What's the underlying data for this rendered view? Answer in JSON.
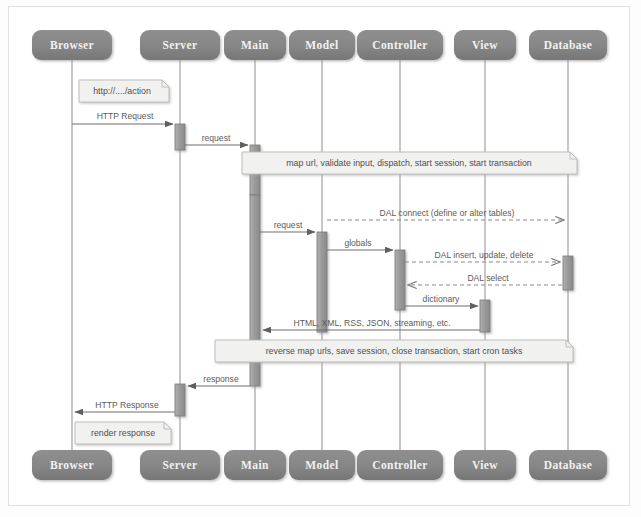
{
  "diagram": {
    "type": "uml-sequence-diagram",
    "colors": {
      "lifeline_box_fill": "#858585",
      "lifeline_box_fill_dark": "#6e6e6e",
      "lifeline_label_text": "#f2f2f2",
      "lifeline_line": "#9a9a9a",
      "activation_fill": "#9d9d9d",
      "activation_stroke": "#7a7a7a",
      "message_line": "#6f6f6f",
      "message_text": "#5b5b5b",
      "note_fill": "#f0f0ee",
      "note_stroke": "#b9b9b9",
      "note_text": "#4f4f4f",
      "canvas": "#ffffff",
      "frame_border": "#e2e2e2"
    },
    "participants": [
      {
        "id": "browser",
        "label": "Browser",
        "x": 72,
        "box_width": 80
      },
      {
        "id": "server",
        "label": "Server",
        "x": 180,
        "box_width": 80
      },
      {
        "id": "main",
        "label": "Main",
        "x": 255,
        "box_width": 62
      },
      {
        "id": "model",
        "label": "Model",
        "x": 322,
        "box_width": 66
      },
      {
        "id": "controller",
        "label": "Controller",
        "x": 400,
        "box_width": 86
      },
      {
        "id": "view",
        "label": "View",
        "x": 485,
        "box_width": 62
      },
      {
        "id": "database",
        "label": "Database",
        "x": 568,
        "box_width": 78
      }
    ],
    "header_boxes": {
      "y": 30,
      "height": 30
    },
    "footer_boxes": {
      "y": 450,
      "height": 30
    },
    "lifeline_span": {
      "top": 60,
      "bottom": 450
    },
    "activations": [
      {
        "id": "act-server-1",
        "participant": "server",
        "top": 124,
        "height": 26
      },
      {
        "id": "act-main-1",
        "participant": "main",
        "top": 145,
        "height": 50
      },
      {
        "id": "act-main-2",
        "participant": "main",
        "top": 195,
        "height": 145
      },
      {
        "id": "act-model-1",
        "participant": "model",
        "top": 232,
        "height": 100
      },
      {
        "id": "act-controller-1",
        "participant": "controller",
        "top": 250,
        "height": 60
      },
      {
        "id": "act-view-1",
        "participant": "view",
        "top": 300,
        "height": 32
      },
      {
        "id": "act-database-1",
        "participant": "database",
        "top": 256,
        "height": 34
      },
      {
        "id": "act-main-3",
        "participant": "main",
        "top": 356,
        "height": 30
      },
      {
        "id": "act-server-2",
        "participant": "server",
        "top": 384,
        "height": 32
      }
    ],
    "messages": [
      {
        "id": "msg-http-request",
        "label": "HTTP Request",
        "from": "browser",
        "to": "server",
        "y": 124,
        "style": "solid",
        "arrow": "filled",
        "direction": "right"
      },
      {
        "id": "msg-request-1",
        "label": "request",
        "from": "server",
        "to": "main",
        "y": 145,
        "style": "solid",
        "arrow": "filled",
        "direction": "right"
      },
      {
        "id": "msg-request-2",
        "label": "request",
        "from": "main",
        "to": "model",
        "y": 232,
        "style": "solid",
        "arrow": "filled",
        "direction": "right"
      },
      {
        "id": "msg-dal-connect",
        "label": "DAL connect (define or alter tables)",
        "from": "model",
        "to": "database",
        "y": 220,
        "style": "dashed",
        "arrow": "open",
        "direction": "right"
      },
      {
        "id": "msg-globals",
        "label": "globals",
        "from": "model",
        "to": "controller",
        "y": 250,
        "style": "solid",
        "arrow": "filled",
        "direction": "right"
      },
      {
        "id": "msg-dal-iud",
        "label": "DAL insert, update, delete",
        "from": "controller",
        "to": "database",
        "y": 262,
        "style": "dashed",
        "arrow": "open",
        "direction": "right"
      },
      {
        "id": "msg-dal-select",
        "label": "DAL select",
        "from": "database",
        "to": "controller",
        "y": 285,
        "style": "dashed",
        "arrow": "open",
        "direction": "left"
      },
      {
        "id": "msg-dictionary",
        "label": "dictionary",
        "from": "controller",
        "to": "view",
        "y": 306,
        "style": "solid",
        "arrow": "filled",
        "direction": "right"
      },
      {
        "id": "msg-render-formats",
        "label": "HTML, XML, RSS, JSON, streaming, etc.",
        "from": "view",
        "to": "main",
        "y": 330,
        "style": "solid",
        "arrow": "filled",
        "direction": "left"
      },
      {
        "id": "msg-response-1",
        "label": "response",
        "from": "main",
        "to": "server",
        "y": 386,
        "style": "solid",
        "arrow": "filled",
        "direction": "left"
      },
      {
        "id": "msg-http-response",
        "label": "HTTP Response",
        "from": "server",
        "to": "browser",
        "y": 412,
        "style": "solid",
        "arrow": "filled",
        "direction": "left"
      }
    ],
    "notes": [
      {
        "id": "note-url",
        "label": "http://..../action",
        "x": 79,
        "y": 80,
        "width": 90,
        "height": 22,
        "align": "left"
      },
      {
        "id": "note-map-url",
        "label": "map url, validate input, dispatch, start session, start transaction",
        "x": 242,
        "y": 152,
        "width": 335,
        "height": 22,
        "align": "center"
      },
      {
        "id": "note-reverse-map",
        "label": "reverse map urls, save session, close transaction, start cron tasks",
        "x": 215,
        "y": 340,
        "width": 358,
        "height": 22,
        "align": "center"
      },
      {
        "id": "note-render-response",
        "label": "render response",
        "x": 75,
        "y": 422,
        "width": 96,
        "height": 22,
        "align": "center"
      }
    ]
  }
}
